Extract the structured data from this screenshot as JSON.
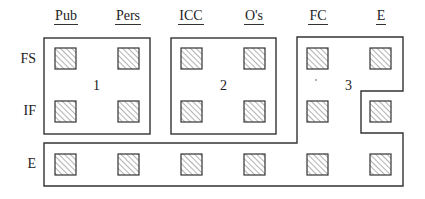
{
  "columns": [
    {
      "label": "Pub",
      "x": 66
    },
    {
      "label": "Pers",
      "x": 128
    },
    {
      "label": "ICC",
      "x": 191
    },
    {
      "label": "O's",
      "x": 254
    },
    {
      "label": "FC",
      "x": 318
    },
    {
      "label": "E",
      "x": 381
    }
  ],
  "rows": [
    {
      "label": "FS",
      "y": 59
    },
    {
      "label": "IF",
      "y": 111
    },
    {
      "label": "E",
      "y": 164
    }
  ],
  "regions": [
    {
      "number": "1",
      "x": 97,
      "y": 87
    },
    {
      "number": "2",
      "x": 224,
      "y": 87
    },
    {
      "number": "3",
      "x": 349,
      "y": 87
    }
  ],
  "colors": {
    "line": "#333333",
    "hatch": "#555555",
    "background": "#ffffff"
  }
}
